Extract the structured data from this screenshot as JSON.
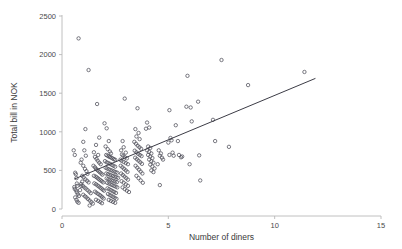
{
  "chart_data": {
    "type": "scatter",
    "title": "",
    "xlabel": "Number of diners",
    "ylabel": "Total bill in NOK",
    "xlim": [
      0,
      15
    ],
    "ylim": [
      0,
      2500
    ],
    "xticks": [
      0,
      5,
      10,
      15
    ],
    "yticks": [
      0,
      500,
      1000,
      1500,
      2000,
      2500
    ],
    "xtick_labels": [
      "0",
      "5",
      "10",
      "15"
    ],
    "ytick_labels": [
      "0",
      "500",
      "1000",
      "1500",
      "2000",
      "2500"
    ],
    "grid": false,
    "legend": null,
    "marker": "open-circle",
    "marker_color": "#4d4d58",
    "line_color": "#3c3c46",
    "background_color": "#ffffff",
    "axis_color": "#b9b9b9",
    "trendline": {
      "label": "linear fit",
      "x": [
        0.6,
        11.9
      ],
      "y": [
        390,
        1690
      ],
      "slope": 115.0,
      "intercept": 321.0
    },
    "points": [
      [
        0.55,
        760
      ],
      [
        0.6,
        700
      ],
      [
        0.62,
        470
      ],
      [
        0.65,
        450
      ],
      [
        0.68,
        400
      ],
      [
        0.7,
        330
      ],
      [
        0.72,
        300
      ],
      [
        0.58,
        285
      ],
      [
        0.6,
        260
      ],
      [
        0.66,
        240
      ],
      [
        0.7,
        215
      ],
      [
        0.75,
        190
      ],
      [
        0.8,
        170
      ],
      [
        0.62,
        150
      ],
      [
        0.68,
        120
      ],
      [
        0.72,
        95
      ],
      [
        0.78,
        80
      ],
      [
        0.85,
        245
      ],
      [
        0.9,
        300
      ],
      [
        0.95,
        355
      ],
      [
        0.78,
        2210
      ],
      [
        1.25,
        1800
      ],
      [
        1.1,
        1035
      ],
      [
        1.0,
        870
      ],
      [
        1.05,
        760
      ],
      [
        1.12,
        690
      ],
      [
        0.92,
        640
      ],
      [
        0.88,
        600
      ],
      [
        1.0,
        560
      ],
      [
        1.08,
        520
      ],
      [
        1.15,
        490
      ],
      [
        1.2,
        455
      ],
      [
        0.95,
        430
      ],
      [
        1.02,
        410
      ],
      [
        1.1,
        385
      ],
      [
        1.18,
        365
      ],
      [
        1.25,
        345
      ],
      [
        0.9,
        325
      ],
      [
        0.98,
        300
      ],
      [
        1.05,
        280
      ],
      [
        1.12,
        265
      ],
      [
        1.2,
        245
      ],
      [
        1.28,
        225
      ],
      [
        1.35,
        205
      ],
      [
        1.0,
        185
      ],
      [
        1.08,
        165
      ],
      [
        1.15,
        150
      ],
      [
        1.22,
        130
      ],
      [
        1.3,
        110
      ],
      [
        1.38,
        90
      ],
      [
        1.45,
        70
      ],
      [
        1.3,
        45
      ],
      [
        1.65,
        1360
      ],
      [
        1.75,
        925
      ],
      [
        1.6,
        830
      ],
      [
        1.5,
        735
      ],
      [
        1.7,
        700
      ],
      [
        1.55,
        675
      ],
      [
        1.62,
        650
      ],
      [
        1.68,
        625
      ],
      [
        1.75,
        600
      ],
      [
        1.82,
        580
      ],
      [
        1.48,
        560
      ],
      [
        1.55,
        540
      ],
      [
        1.6,
        520
      ],
      [
        1.66,
        505
      ],
      [
        1.72,
        490
      ],
      [
        1.78,
        475
      ],
      [
        1.85,
        460
      ],
      [
        1.9,
        445
      ],
      [
        1.5,
        430
      ],
      [
        1.58,
        420
      ],
      [
        1.64,
        408
      ],
      [
        1.7,
        395
      ],
      [
        1.76,
        382
      ],
      [
        1.82,
        370
      ],
      [
        1.88,
        358
      ],
      [
        1.94,
        345
      ],
      [
        1.52,
        332
      ],
      [
        1.6,
        320
      ],
      [
        1.67,
        305
      ],
      [
        1.73,
        292
      ],
      [
        1.8,
        278
      ],
      [
        1.86,
        265
      ],
      [
        1.92,
        250
      ],
      [
        1.98,
        238
      ],
      [
        1.55,
        225
      ],
      [
        1.62,
        210
      ],
      [
        1.7,
        195
      ],
      [
        1.78,
        180
      ],
      [
        1.85,
        165
      ],
      [
        1.9,
        150
      ],
      [
        1.96,
        135
      ],
      [
        1.6,
        120
      ],
      [
        1.7,
        105
      ],
      [
        1.8,
        90
      ],
      [
        1.88,
        75
      ],
      [
        2.0,
        1110
      ],
      [
        2.1,
        1045
      ],
      [
        2.2,
        880
      ],
      [
        2.05,
        810
      ],
      [
        2.15,
        775
      ],
      [
        2.25,
        745
      ],
      [
        2.3,
        720
      ],
      [
        2.08,
        700
      ],
      [
        2.14,
        690
      ],
      [
        2.2,
        680
      ],
      [
        2.26,
        672
      ],
      [
        2.32,
        665
      ],
      [
        2.38,
        655
      ],
      [
        2.44,
        645
      ],
      [
        2.5,
        638
      ],
      [
        2.02,
        620
      ],
      [
        2.1,
        605
      ],
      [
        2.18,
        595
      ],
      [
        2.26,
        585
      ],
      [
        2.34,
        572
      ],
      [
        2.42,
        560
      ],
      [
        2.5,
        548
      ],
      [
        2.05,
        535
      ],
      [
        2.12,
        525
      ],
      [
        2.2,
        515
      ],
      [
        2.28,
        505
      ],
      [
        2.36,
        497
      ],
      [
        2.44,
        488
      ],
      [
        2.52,
        478
      ],
      [
        2.6,
        470
      ],
      [
        2.08,
        460
      ],
      [
        2.16,
        452
      ],
      [
        2.24,
        444
      ],
      [
        2.32,
        436
      ],
      [
        2.4,
        428
      ],
      [
        2.48,
        420
      ],
      [
        2.56,
        412
      ],
      [
        2.64,
        404
      ],
      [
        2.1,
        396
      ],
      [
        2.18,
        388
      ],
      [
        2.26,
        380
      ],
      [
        2.34,
        372
      ],
      [
        2.42,
        364
      ],
      [
        2.5,
        356
      ],
      [
        2.58,
        348
      ],
      [
        2.12,
        340
      ],
      [
        2.2,
        330
      ],
      [
        2.28,
        320
      ],
      [
        2.36,
        310
      ],
      [
        2.44,
        300
      ],
      [
        2.52,
        290
      ],
      [
        2.6,
        280
      ],
      [
        2.14,
        268
      ],
      [
        2.22,
        256
      ],
      [
        2.3,
        244
      ],
      [
        2.38,
        232
      ],
      [
        2.46,
        220
      ],
      [
        2.54,
        208
      ],
      [
        2.16,
        195
      ],
      [
        2.24,
        182
      ],
      [
        2.32,
        170
      ],
      [
        2.4,
        158
      ],
      [
        2.48,
        145
      ],
      [
        2.56,
        132
      ],
      [
        2.2,
        118
      ],
      [
        2.3,
        105
      ],
      [
        2.4,
        92
      ],
      [
        2.5,
        80
      ],
      [
        2.95,
        1430
      ],
      [
        2.85,
        880
      ],
      [
        2.9,
        800
      ],
      [
        2.78,
        760
      ],
      [
        3.0,
        730
      ],
      [
        2.82,
        705
      ],
      [
        2.88,
        690
      ],
      [
        2.96,
        670
      ],
      [
        3.05,
        655
      ],
      [
        2.75,
        640
      ],
      [
        2.8,
        625
      ],
      [
        2.9,
        610
      ],
      [
        3.0,
        595
      ],
      [
        3.1,
        580
      ],
      [
        2.76,
        560
      ],
      [
        2.84,
        540
      ],
      [
        2.92,
        520
      ],
      [
        3.0,
        500
      ],
      [
        3.08,
        480
      ],
      [
        2.78,
        460
      ],
      [
        2.86,
        440
      ],
      [
        2.94,
        420
      ],
      [
        3.02,
        400
      ],
      [
        3.1,
        380
      ],
      [
        2.8,
        360
      ],
      [
        2.9,
        340
      ],
      [
        3.0,
        320
      ],
      [
        3.1,
        300
      ],
      [
        2.85,
        280
      ],
      [
        2.95,
        258
      ],
      [
        3.05,
        238
      ],
      [
        3.15,
        220
      ],
      [
        3.55,
        1305
      ],
      [
        3.45,
        1035
      ],
      [
        3.6,
        985
      ],
      [
        3.5,
        940
      ],
      [
        3.65,
        905
      ],
      [
        3.4,
        870
      ],
      [
        3.48,
        845
      ],
      [
        3.56,
        820
      ],
      [
        3.64,
        800
      ],
      [
        3.72,
        780
      ],
      [
        3.42,
        755
      ],
      [
        3.5,
        735
      ],
      [
        3.58,
        715
      ],
      [
        3.66,
        700
      ],
      [
        3.74,
        685
      ],
      [
        3.44,
        665
      ],
      [
        3.52,
        645
      ],
      [
        3.6,
        625
      ],
      [
        3.68,
        605
      ],
      [
        3.76,
        585
      ],
      [
        3.46,
        560
      ],
      [
        3.54,
        535
      ],
      [
        3.62,
        510
      ],
      [
        3.7,
        485
      ],
      [
        3.78,
        460
      ],
      [
        3.5,
        430
      ],
      [
        3.6,
        400
      ],
      [
        3.7,
        370
      ],
      [
        3.8,
        340
      ],
      [
        4.0,
        1120
      ],
      [
        4.1,
        1055
      ],
      [
        3.95,
        1040
      ],
      [
        4.05,
        810
      ],
      [
        4.15,
        790
      ],
      [
        4.0,
        760
      ],
      [
        4.1,
        740
      ],
      [
        4.2,
        720
      ],
      [
        4.05,
        700
      ],
      [
        4.15,
        680
      ],
      [
        4.25,
        660
      ],
      [
        4.1,
        640
      ],
      [
        4.2,
        618
      ],
      [
        4.3,
        600
      ],
      [
        4.15,
        575
      ],
      [
        4.25,
        550
      ],
      [
        4.35,
        525
      ],
      [
        4.2,
        500
      ],
      [
        4.3,
        478
      ],
      [
        4.55,
        760
      ],
      [
        4.65,
        720
      ],
      [
        4.6,
        690
      ],
      [
        4.7,
        665
      ],
      [
        4.75,
        640
      ],
      [
        4.5,
        580
      ],
      [
        4.6,
        310
      ],
      [
        5.05,
        1280
      ],
      [
        5.1,
        920
      ],
      [
        5.15,
        890
      ],
      [
        5.0,
        860
      ],
      [
        5.2,
        730
      ],
      [
        5.05,
        700
      ],
      [
        5.25,
        690
      ],
      [
        5.35,
        1085
      ],
      [
        5.45,
        880
      ],
      [
        5.5,
        700
      ],
      [
        5.6,
        670
      ],
      [
        5.65,
        680
      ],
      [
        5.9,
        1725
      ],
      [
        5.85,
        1325
      ],
      [
        6.05,
        1315
      ],
      [
        6.1,
        1135
      ],
      [
        6.0,
        580
      ],
      [
        6.4,
        1390
      ],
      [
        6.45,
        695
      ],
      [
        6.5,
        370
      ],
      [
        7.1,
        1155
      ],
      [
        7.2,
        880
      ],
      [
        7.5,
        1930
      ],
      [
        7.85,
        805
      ],
      [
        8.75,
        1605
      ],
      [
        11.4,
        1775
      ]
    ]
  },
  "axis": {
    "x_title": "Number of diners",
    "y_title": "Total bill in NOK"
  }
}
